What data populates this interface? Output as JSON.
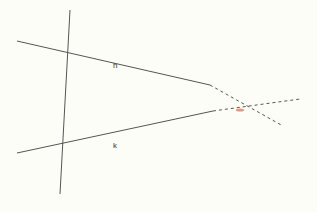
{
  "diagram": {
    "labels": {
      "h": "h",
      "k": "k"
    },
    "colors": {
      "background": "#fdfdf8",
      "line": "#555555",
      "intersection": "#e07a5f"
    }
  }
}
